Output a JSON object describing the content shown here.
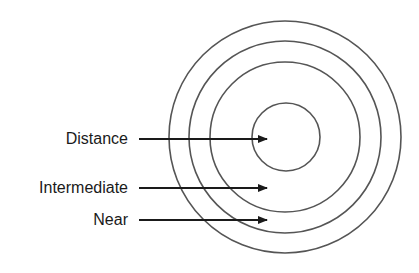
{
  "diagram": {
    "type": "concentric-zones",
    "center": {
      "x": 285,
      "y": 137
    },
    "rings": [
      {
        "name": "outer",
        "radius": 116
      },
      {
        "name": "second",
        "radius": 96
      },
      {
        "name": "third",
        "radius": 75
      },
      {
        "name": "inner",
        "radius": 34
      }
    ],
    "stroke_color": "#555555",
    "arrow_color": "#1a1a1a",
    "labels": [
      {
        "text": "Distance",
        "y": 139
      },
      {
        "text": "Intermediate",
        "y": 188
      },
      {
        "text": "Near",
        "y": 220
      }
    ],
    "arrow_start_x": 139,
    "arrow_end_x": 267
  }
}
